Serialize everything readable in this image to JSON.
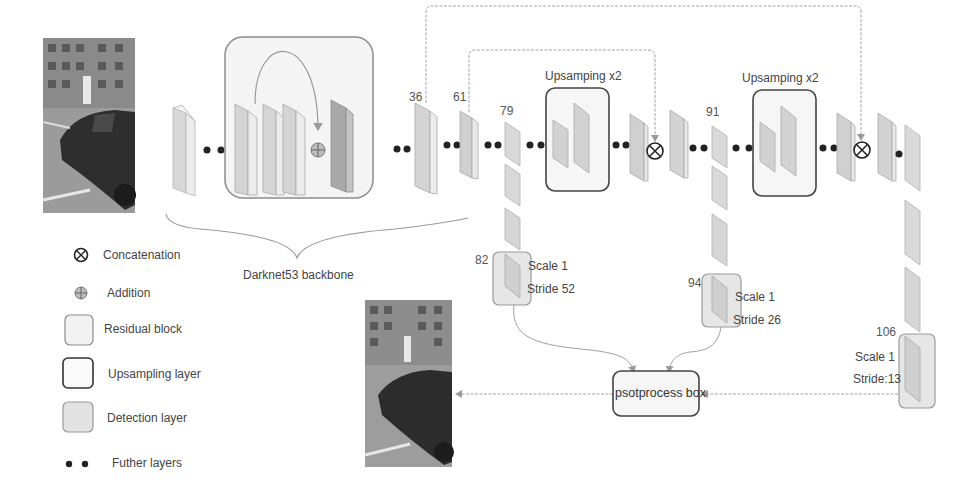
{
  "diagram": {
    "backbone_label": "Darknet53 backbone",
    "upsampling_labels": [
      "Upsamping x2",
      "Upsamping x2"
    ],
    "layer_numbers": {
      "l36": "36",
      "l61": "61",
      "l79": "79",
      "l91": "91",
      "l82": "82",
      "l94": "94",
      "l106": "106"
    },
    "detections": [
      {
        "id": "82",
        "scale": "Scale 1",
        "stride": "Stride 52"
      },
      {
        "id": "94",
        "scale": "Scale 1",
        "stride": "Stride 26"
      },
      {
        "id": "106",
        "scale": "Scale 1",
        "stride": "Stride:13"
      }
    ],
    "postprocess_label": "psotprocess box",
    "input_image": "street-scene-car-input",
    "output_image": "street-scene-car-output"
  },
  "legend": {
    "items": [
      {
        "icon": "concatenation-icon",
        "label": "Concatenation"
      },
      {
        "icon": "addition-icon",
        "label": "Addition"
      },
      {
        "icon": "residual-block-icon",
        "label": "Residual block"
      },
      {
        "icon": "upsampling-layer-icon",
        "label": "Upsampling layer"
      },
      {
        "icon": "detection-layer-icon",
        "label": "Detection layer"
      },
      {
        "icon": "further-layers-icon",
        "label": "Futher layers"
      }
    ]
  },
  "colors": {
    "layer_fill": "#d9d9d9",
    "layer_side": "#efefef",
    "layer_dark": "#a8a8a8",
    "box_border": "#555555",
    "residual_border": "#888888",
    "detection_fill": "#e4e4e4",
    "arrow": "#999999",
    "dot": "#222222"
  }
}
